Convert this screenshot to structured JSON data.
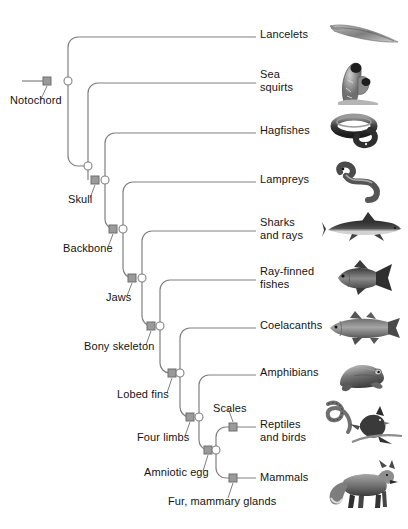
{
  "diagram": {
    "type": "cladogram",
    "style": {
      "line_color": "#808080",
      "node_square_fill": "#9a9a9a",
      "node_square_stroke": "#6e6e6e",
      "node_circle_fill": "#ffffff",
      "node_circle_stroke": "#808080",
      "text_color": "#141414",
      "background": "#ffffff"
    }
  },
  "tips": [
    {
      "id": "lancelets",
      "label": "Lancelets",
      "x": 256,
      "y": 35,
      "label_x": 260,
      "label_y": 28,
      "organism": "lancelet-image"
    },
    {
      "id": "sea-squirts",
      "label": "Sea\nsquirts",
      "x": 256,
      "y": 81,
      "label_x": 260,
      "label_y": 68,
      "organism": "sea-squirt-image"
    },
    {
      "id": "hagfishes",
      "label": "Hagfishes",
      "x": 256,
      "y": 131,
      "label_x": 260,
      "label_y": 124,
      "organism": "hagfish-image"
    },
    {
      "id": "lampreys",
      "label": "Lampreys",
      "x": 256,
      "y": 180,
      "label_x": 260,
      "label_y": 173,
      "organism": "lamprey-image"
    },
    {
      "id": "sharks-rays",
      "label": "Sharks\nand rays",
      "x": 256,
      "y": 229,
      "label_x": 260,
      "label_y": 216,
      "organism": "shark-image"
    },
    {
      "id": "ray-finned",
      "label": "Ray-finned\nfishes",
      "x": 256,
      "y": 278,
      "label_x": 260,
      "label_y": 265,
      "organism": "ray-finned-fish-image"
    },
    {
      "id": "coelacanths",
      "label": "Coelacanths",
      "x": 256,
      "y": 326,
      "label_x": 260,
      "label_y": 319,
      "organism": "coelacanth-image"
    },
    {
      "id": "amphibians",
      "label": "Amphibians",
      "x": 256,
      "y": 373,
      "label_x": 260,
      "label_y": 366,
      "organism": "frog-image"
    },
    {
      "id": "reptiles-birds",
      "label": "Reptiles\nand birds",
      "x": 256,
      "y": 427,
      "label_x": 260,
      "label_y": 418,
      "organism": "snake-and-bird-image"
    },
    {
      "id": "mammals",
      "label": "Mammals",
      "x": 256,
      "y": 478,
      "label_x": 260,
      "label_y": 471,
      "organism": "fox-image"
    }
  ],
  "traits": [
    {
      "id": "notochord",
      "label": "Notochord",
      "marker_x": 47,
      "marker_y": 81,
      "label_x": 10,
      "label_y": 94,
      "leader": "down-left"
    },
    {
      "id": "skull",
      "label": "Skull",
      "marker_x": 95,
      "marker_y": 180,
      "label_x": 68,
      "label_y": 193,
      "leader": "down-left"
    },
    {
      "id": "backbone",
      "label": "Backbone",
      "marker_x": 113,
      "marker_y": 229,
      "label_x": 63,
      "label_y": 242,
      "leader": "down-left"
    },
    {
      "id": "jaws",
      "label": "Jaws",
      "marker_x": 132,
      "marker_y": 278,
      "label_x": 106,
      "label_y": 291,
      "leader": "down-left"
    },
    {
      "id": "bony-skeleton",
      "label": "Bony skeleton",
      "marker_x": 151,
      "marker_y": 326,
      "label_x": 84,
      "label_y": 340,
      "leader": "down-left"
    },
    {
      "id": "lobed-fins",
      "label": "Lobed fins",
      "marker_x": 172,
      "marker_y": 373,
      "label_x": 117,
      "label_y": 388,
      "leader": "down-left"
    },
    {
      "id": "four-limbs",
      "label": "Four limbs",
      "marker_x": 190,
      "marker_y": 417,
      "label_x": 137,
      "label_y": 431,
      "leader": "down-left"
    },
    {
      "id": "amniotic-egg",
      "label": "Amniotic egg",
      "marker_x": 208,
      "marker_y": 450,
      "label_x": 144,
      "label_y": 466,
      "leader": "down-left"
    },
    {
      "id": "scales",
      "label": "Scales",
      "marker_x": 233,
      "marker_y": 427,
      "label_x": 213,
      "label_y": 402,
      "leader": "up-left"
    },
    {
      "id": "fur-mammary",
      "label": "Fur, mammary glands",
      "marker_x": 233,
      "marker_y": 478,
      "label_x": 168,
      "label_y": 495,
      "leader": "down-left"
    }
  ],
  "nodes": [
    {
      "id": "node-chordata",
      "x": 68,
      "y": 81
    },
    {
      "id": "node-craniata",
      "x": 105,
      "y": 180
    },
    {
      "id": "node-vertebrata",
      "x": 123,
      "y": 229
    },
    {
      "id": "node-gnathostomata",
      "x": 142,
      "y": 278
    },
    {
      "id": "node-osteichthyes",
      "x": 160,
      "y": 326
    },
    {
      "id": "node-sarcopterygii",
      "x": 180,
      "y": 373
    },
    {
      "id": "node-tetrapoda",
      "x": 199,
      "y": 417
    },
    {
      "id": "node-amniota",
      "x": 216,
      "y": 450
    }
  ],
  "root": {
    "x_start": 22,
    "x_end": 47,
    "y": 81
  }
}
